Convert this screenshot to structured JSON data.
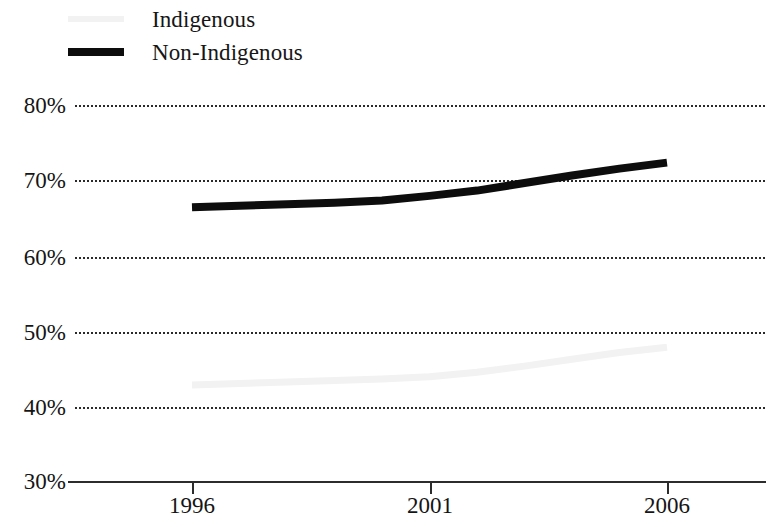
{
  "legend": {
    "position": "top-left",
    "items": [
      {
        "label": "Indigenous",
        "color": "#f2f2f2",
        "swatch": "line-swatch-indigenous"
      },
      {
        "label": "Non-Indigenous",
        "color": "#0d0d0d",
        "swatch": "line-swatch-non-indigenous"
      }
    ]
  },
  "axes": {
    "y_ticks": [
      "80%",
      "70%",
      "60%",
      "50%",
      "40%",
      "30%"
    ],
    "x_ticks": [
      "1996",
      "2001",
      "2006"
    ]
  },
  "chart_data": {
    "type": "line",
    "title": "",
    "xlabel": "",
    "ylabel": "",
    "xlim": [
      1995.75,
      2006.0
    ],
    "ylim": [
      30,
      80
    ],
    "ytick_values": [
      80,
      70,
      60,
      50,
      40,
      30
    ],
    "ytick_labels": [
      "80%",
      "70%",
      "60%",
      "50%",
      "40%",
      "30%"
    ],
    "xtick_values": [
      1996,
      2001,
      2006
    ],
    "xtick_labels": [
      "1996",
      "2001",
      "2006"
    ],
    "grid": "horizontal-dotted",
    "legend_position": "top-left",
    "x": [
      1996,
      1997,
      1998,
      1999,
      2000,
      2001,
      2002,
      2003,
      2004,
      2005,
      2006
    ],
    "series": [
      {
        "name": "Indigenous",
        "color": "#f2f2f2",
        "values": [
          42.9,
          43.1,
          43.3,
          43.5,
          43.7,
          44.0,
          44.6,
          45.4,
          46.3,
          47.2,
          47.9
        ]
      },
      {
        "name": "Non-Indigenous",
        "color": "#0d0d0d",
        "values": [
          66.4,
          66.6,
          66.8,
          67.0,
          67.3,
          67.9,
          68.6,
          69.6,
          70.6,
          71.5,
          72.3
        ]
      }
    ]
  }
}
